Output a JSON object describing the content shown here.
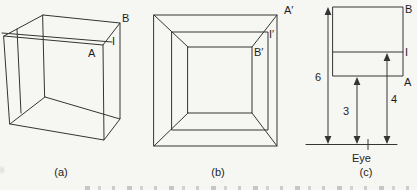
{
  "colors": {
    "background": "#f6f6f2",
    "line": "#343434",
    "text": "#1e1e1e"
  },
  "panel_a": {
    "caption": "(a)",
    "label_A": "A",
    "label_I": "I",
    "label_B": "B"
  },
  "panel_b": {
    "caption": "(b)",
    "label_A_prime": "A′",
    "label_I_prime": "I′",
    "label_B_prime": "B′"
  },
  "panel_c": {
    "caption": "(c)",
    "label_B": "B",
    "label_I": "I",
    "label_A": "A",
    "dim_total_height": "6",
    "dim_lower_height": "3",
    "dim_I_height": "4",
    "eye_label": "Eye"
  }
}
